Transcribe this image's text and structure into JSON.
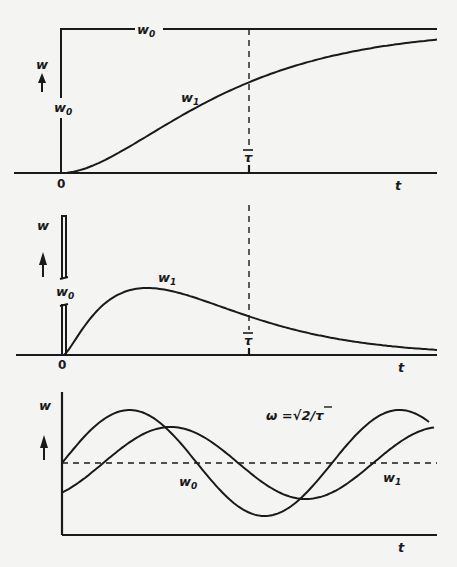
{
  "chart_data": [
    {
      "type": "line",
      "title": "Step input response",
      "ylabel": "w",
      "xlabel": "t",
      "origin_label": "0",
      "marker_label": "τ̄",
      "series": [
        {
          "name": "w0",
          "label": "w",
          "sub": "0",
          "description": "step input of height w0 at t=0"
        },
        {
          "name": "w1",
          "label": "w",
          "sub": "1",
          "description": "first-order-like rise toward w0, value approx 0.63·w0 at τ̄"
        }
      ],
      "step_level": 1.0,
      "w1_at_tau": 0.63,
      "x_range_tau_units": [
        0,
        2.0
      ],
      "y_range": [
        0,
        1.0
      ]
    },
    {
      "type": "line",
      "title": "Impulse input response",
      "ylabel": "w",
      "xlabel": "t",
      "origin_label": "0",
      "marker_label": "τ̄",
      "series": [
        {
          "name": "w0",
          "label": "w",
          "sub": "0",
          "description": "impulse at t=0 (broken bar)"
        },
        {
          "name": "w1",
          "label": "w",
          "sub": "1",
          "description": "rises to peak near 0.45·τ̄ then decays"
        }
      ],
      "w1_peak_time_tau_units": 0.45,
      "w1_peak_value": 1.0,
      "w1_at_tau": 0.78,
      "w1_at_end": 0.2,
      "x_range_tau_units": [
        0,
        2.0
      ]
    },
    {
      "type": "line",
      "title": "Sinusoidal input response",
      "ylabel": "w",
      "xlabel": "t",
      "annotation": "ω =√2/τ̄",
      "series": [
        {
          "name": "w0",
          "label": "w",
          "sub": "0",
          "description": "sinusoidal input, amplitude 1.0, starts at mean going up",
          "amplitude": 1.0,
          "phase_deg": 0
        },
        {
          "name": "w1",
          "label": "w",
          "sub": "1",
          "description": "sinusoidal output, reduced amplitude and phase lag",
          "amplitude": 0.68,
          "phase_deg": -55
        }
      ],
      "mean_line": "dashed",
      "periods_shown": 1.35
    }
  ],
  "labels": {
    "w": "w",
    "t": "t",
    "zero": "0",
    "tau": "τ",
    "sub0": "0",
    "sub1": "1",
    "omega_eq": "ω =√2/τ"
  }
}
